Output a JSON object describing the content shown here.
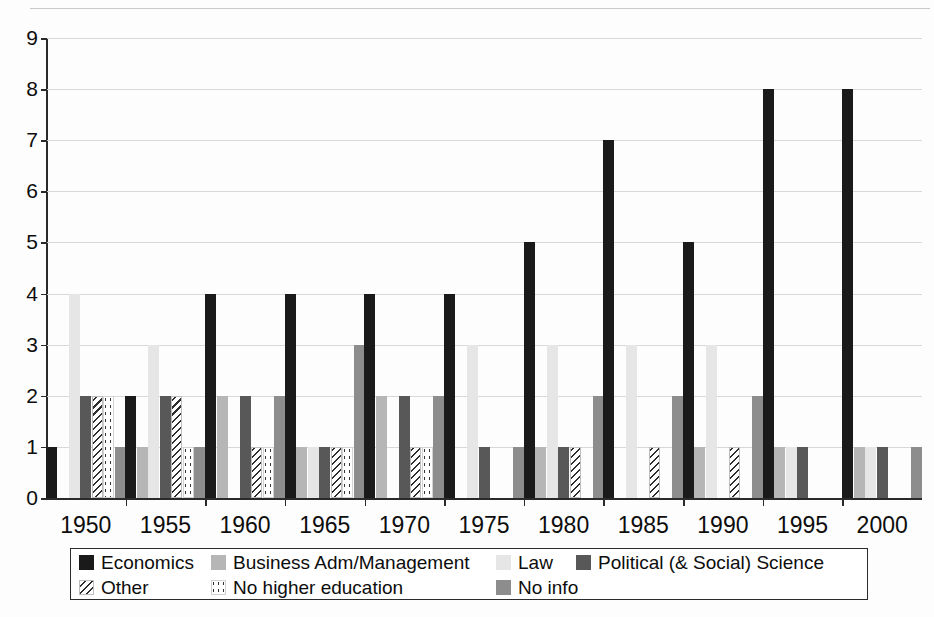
{
  "chart_data": {
    "type": "bar",
    "title": "",
    "subtitle": "",
    "xlabel": "",
    "ylabel": "",
    "ylim": [
      0,
      9
    ],
    "y_ticks": [
      0,
      1,
      2,
      3,
      4,
      5,
      6,
      7,
      8,
      9
    ],
    "y_tick_labels": [
      "0",
      "1",
      "2",
      "3",
      "4",
      "5",
      "6",
      "7",
      "8",
      "9"
    ],
    "grid": true,
    "grid_axis": "y",
    "legend_position": "bottom",
    "legend_columns": 4,
    "categories": [
      "1950",
      "1955",
      "1960",
      "1965",
      "1970",
      "1975",
      "1980",
      "1985",
      "1990",
      "1995",
      "2000"
    ],
    "x_tick_labels": [
      "1950",
      "1955",
      "1960",
      "1965",
      "1970",
      "1975",
      "1980",
      "1985",
      "1990",
      "1995",
      "2000"
    ],
    "series": [
      {
        "name": "Economics",
        "color": "#1a1a1a",
        "pattern": "solid",
        "swatch_class": "sw-economics",
        "values": [
          1,
          2,
          4,
          4,
          4,
          4,
          5,
          7,
          5,
          8,
          8
        ]
      },
      {
        "name": "Business Adm/Management",
        "color": "#b6b6b6",
        "pattern": "solid",
        "swatch_class": "sw-business",
        "values": [
          0,
          1,
          2,
          1,
          2,
          0,
          1,
          0,
          1,
          1,
          1
        ]
      },
      {
        "name": "Law",
        "color": "#e6e6e6",
        "pattern": "solid",
        "swatch_class": "sw-law",
        "values": [
          4,
          3,
          0,
          1,
          0,
          3,
          3,
          3,
          3,
          1,
          1
        ]
      },
      {
        "name": "Political (& Social) Science",
        "color": "#585858",
        "pattern": "solid",
        "swatch_class": "sw-polsci",
        "values": [
          2,
          2,
          2,
          1,
          2,
          1,
          1,
          0,
          0,
          1,
          1
        ]
      },
      {
        "name": "Other",
        "color": "#2e2e2e",
        "pattern": "diagonal-hatch",
        "swatch_class": "sw-other",
        "values": [
          2,
          2,
          1,
          1,
          1,
          0,
          1,
          1,
          1,
          0,
          0
        ]
      },
      {
        "name": "No higher education",
        "color": "#333333",
        "pattern": "sparse-dots",
        "swatch_class": "sw-nohighered",
        "values": [
          2,
          1,
          1,
          1,
          1,
          0,
          0,
          0,
          0,
          0,
          0
        ]
      },
      {
        "name": "No info",
        "color": "#8d8d8d",
        "pattern": "solid",
        "swatch_class": "sw-noinfo",
        "values": [
          1,
          1,
          2,
          3,
          2,
          1,
          2,
          2,
          2,
          0,
          1
        ]
      }
    ]
  },
  "legend": {
    "rows": [
      [
        {
          "label": "Economics",
          "swatch_class": "sw-economics",
          "left": 8,
          "swatch_left": 8
        },
        {
          "label": "Business Adm/Management",
          "swatch_class": "sw-business",
          "left": 140,
          "swatch_left": 140
        },
        {
          "label": "Law",
          "swatch_class": "sw-law",
          "left": 425,
          "swatch_left": 425
        },
        {
          "label": "Political (& Social) Science",
          "swatch_class": "sw-polsci",
          "left": 505,
          "swatch_left": 505
        }
      ],
      [
        {
          "label": "Other",
          "swatch_class": "sw-other",
          "left": 8,
          "swatch_left": 8
        },
        {
          "label": "No higher education",
          "swatch_class": "sw-nohighered",
          "left": 140,
          "swatch_left": 140
        },
        {
          "label": "No info",
          "swatch_class": "sw-noinfo",
          "left": 425,
          "swatch_left": 425
        }
      ]
    ]
  }
}
